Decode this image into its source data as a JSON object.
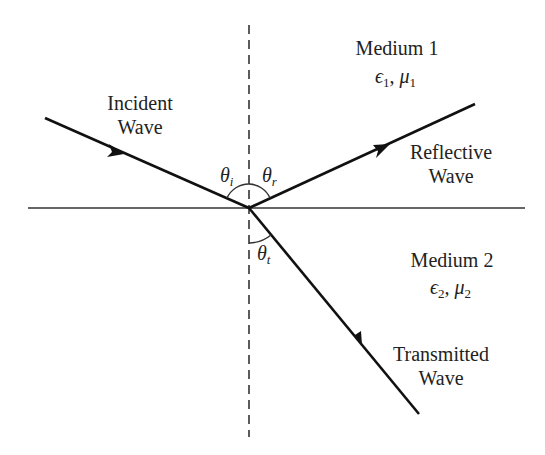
{
  "diagram": {
    "colors": {
      "line": "#111111",
      "text": "#222222",
      "background": "#ffffff"
    },
    "labels": {
      "incident_line1": "Incident",
      "incident_line2": "Wave",
      "reflective_line1": "Reflective",
      "reflective_line2": "Wave",
      "transmitted_line1": "Transmitted",
      "transmitted_line2": "Wave",
      "medium1": "Medium 1",
      "medium1_eps": "ϵ",
      "medium1_eps_sub": "1",
      "medium1_sep": ", ",
      "medium1_mu": "μ",
      "medium1_mu_sub": "1",
      "medium2": "Medium 2",
      "medium2_eps": "ϵ",
      "medium2_eps_sub": "2",
      "medium2_sep": ", ",
      "medium2_mu": "μ",
      "medium2_mu_sub": "2",
      "theta_i": "θ",
      "theta_i_sub": "i",
      "theta_r": "θ",
      "theta_r_sub": "r",
      "theta_t": "θ",
      "theta_t_sub": "t"
    }
  }
}
